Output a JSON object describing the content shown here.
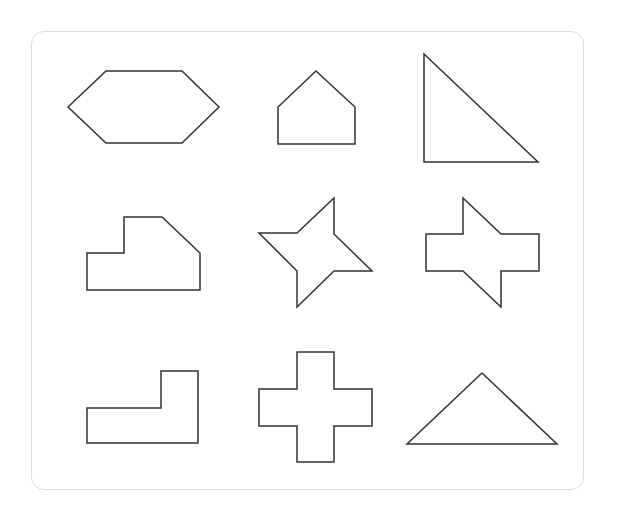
{
  "diagram": {
    "background": "#ffffff",
    "card": {
      "border_color": "#dddddd",
      "x": 31,
      "y": 31,
      "width": 553,
      "height": 459,
      "radius": 13
    },
    "stroke_color": "#333333",
    "shapes": [
      {
        "name": "hexagon",
        "row": 1,
        "col": 1,
        "points": "68,107 106,71 182,71 219,107 182,143 106,143"
      },
      {
        "name": "pentagon-house",
        "row": 1,
        "col": 2,
        "points": "316,71 355,107 355,144 278,144 278,107"
      },
      {
        "name": "right-triangle",
        "row": 1,
        "col": 3,
        "points": "424,54 538,162 424,162"
      },
      {
        "name": "stepped-chamfered-polygon",
        "row": 2,
        "col": 1,
        "points": "87,253 124,253 124,217 162,217 200,253 200,290 87,290"
      },
      {
        "name": "four-point-pinwheel-star",
        "row": 2,
        "col": 2,
        "points": "334,198 334,234 372,271 334,271 297,307 297,271 259,233 297,233"
      },
      {
        "name": "bowtie-cross-polygon",
        "row": 2,
        "col": 3,
        "points": "463,198 501,234 539,234 539,271 501,271 501,307 463,271 426,271 426,234 463,234"
      },
      {
        "name": "l-shape",
        "row": 3,
        "col": 1,
        "points": "87,408 161,408 161,371 198,371 198,443 87,443"
      },
      {
        "name": "plus-cross",
        "row": 3,
        "col": 2,
        "points": "297,352 334,352 334,389 372,389 372,426 334,426 334,462 297,462 297,426 259,426 259,389 297,389"
      },
      {
        "name": "isosceles-triangle",
        "row": 3,
        "col": 3,
        "points": "482,373 557,444 407,444"
      }
    ]
  }
}
